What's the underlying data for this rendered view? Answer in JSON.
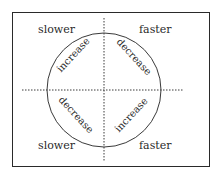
{
  "diagram": {
    "corners": {
      "top_left": "slower",
      "top_right": "faster",
      "bottom_left": "slower",
      "bottom_right": "faster"
    },
    "arcs": {
      "top_left": "increase",
      "top_right": "decrease",
      "bottom_left": "decrease",
      "bottom_right": "increase"
    },
    "colors": {
      "line": "#2a2a2a",
      "background": "#ffffff"
    }
  }
}
